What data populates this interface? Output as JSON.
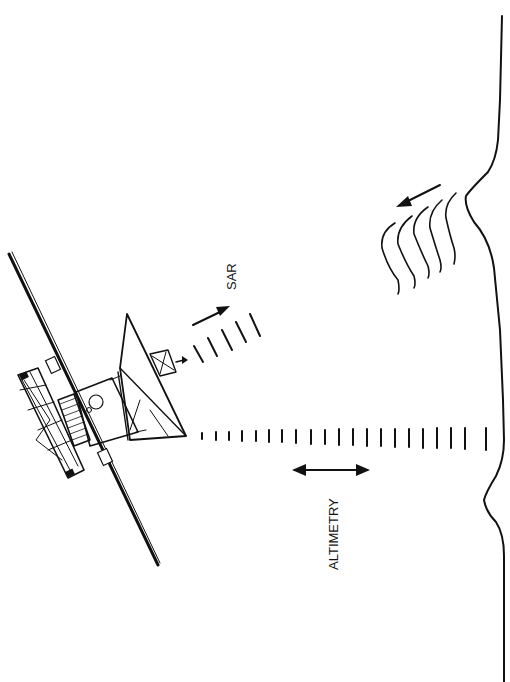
{
  "figure": {
    "labels": {
      "sar": "SAR",
      "altimetry": "ALTIMETRY"
    },
    "colors": {
      "ink": "#111111",
      "background": "#ffffff"
    }
  }
}
